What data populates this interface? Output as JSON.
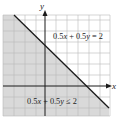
{
  "graph": {
    "axes": {
      "x_label": "x",
      "y_label": "y"
    },
    "boundary_line": {
      "equation": "0.5x + 0.5y = 2",
      "x_intercept": 4,
      "y_intercept": 4
    },
    "inequality": {
      "label": "0.5x + 0.5y ≤ 2",
      "shaded_side": "below"
    },
    "grid": {
      "x_range": [
        -4,
        6
      ],
      "y_range": [
        -3,
        6
      ],
      "unit": 1
    },
    "colors": {
      "shade": "#d9d9d9",
      "grid": "#b8b8b8",
      "line": "#1a1a1a",
      "axis": "#1a1a1a",
      "background": "#ffffff"
    }
  },
  "labels": {
    "line_label_parts": [
      "0.5",
      "x",
      " + 0.5",
      "y",
      " = 2"
    ],
    "ineq_label_parts": [
      "0.5",
      "x",
      " + 0.5",
      "y",
      " ≤ 2"
    ]
  }
}
